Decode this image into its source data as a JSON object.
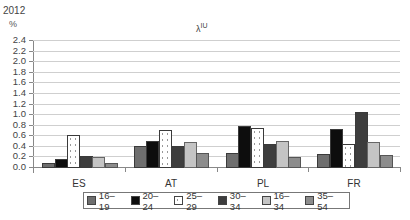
{
  "chart_data": {
    "type": "bar",
    "title": "λIU",
    "title_base": "λ",
    "title_sup": "IU",
    "year_label": "2012",
    "ylabel": "%",
    "xlabel": "",
    "ylim": [
      0,
      2.4
    ],
    "yticks": [
      "0.0",
      "0.2",
      "0.4",
      "0.6",
      "0.8",
      "1.0",
      "1.2",
      "1.4",
      "1.6",
      "1.8",
      "2.0",
      "2.2",
      "2.4"
    ],
    "grid": true,
    "legend_position": "bottom",
    "categories": [
      "ES",
      "AT",
      "PL",
      "FR"
    ],
    "series": [
      {
        "name": "16–19",
        "color": "#6e6e6e",
        "values": [
          0.08,
          0.4,
          0.27,
          0.25
        ]
      },
      {
        "name": "20–24",
        "color": "#0d0d0d",
        "values": [
          0.16,
          0.5,
          0.77,
          0.72
        ]
      },
      {
        "name": "25–29",
        "color": "#ffffff",
        "pattern": "dotted",
        "values": [
          0.6,
          0.7,
          0.74,
          0.43
        ]
      },
      {
        "name": "30–34",
        "color": "#3d3d3d",
        "values": [
          0.2,
          0.4,
          0.44,
          1.04
        ]
      },
      {
        "name": "16–34",
        "color": "#c4c4c4",
        "values": [
          0.18,
          0.47,
          0.5,
          0.47
        ]
      },
      {
        "name": "35–54",
        "color": "#8c8c8c",
        "values": [
          0.07,
          0.27,
          0.18,
          0.23
        ]
      }
    ]
  }
}
